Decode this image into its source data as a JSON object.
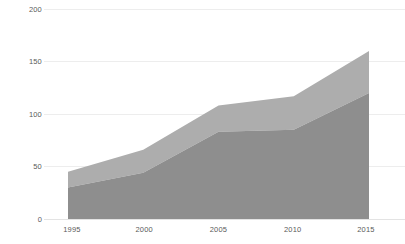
{
  "chart_data": {
    "type": "area",
    "stacked": true,
    "title": "",
    "subtitle": "",
    "xlabel": "",
    "ylabel": "",
    "x": [
      1995,
      2000,
      2005,
      2010,
      2015
    ],
    "categories": [
      "1995",
      "2000",
      "2005",
      "2010",
      "2015"
    ],
    "series": [
      {
        "name": "Lower series",
        "color": "#8e8e8e",
        "values": [
          30,
          44,
          83,
          85,
          120
        ]
      },
      {
        "name": "Upper series",
        "color": "#adadad",
        "values": [
          15,
          22,
          25,
          32,
          40
        ]
      }
    ],
    "cumulative_top": [
      45,
      66,
      108,
      117,
      160
    ],
    "xlim": [
      1995,
      2015
    ],
    "ylim": [
      0,
      200
    ],
    "y_ticks": [
      0,
      50,
      100,
      150,
      200
    ],
    "y_tick_labels": [
      "0",
      "50",
      "100",
      "150",
      "200"
    ],
    "x_ticks": [
      1995,
      2000,
      2005,
      2010,
      2015
    ],
    "x_tick_labels": [
      "1995",
      "2000",
      "2005",
      "2010",
      "2015"
    ],
    "grid": true,
    "grid_axis": "y",
    "legend": false,
    "legend_position": "none",
    "annotations": []
  },
  "axes": {
    "y_labels": [
      "200",
      "150",
      "100",
      "50",
      "0"
    ],
    "x_labels": [
      "1995",
      "2000",
      "2005",
      "2010",
      "2015"
    ]
  },
  "colors": {
    "upper_band": "#adadad",
    "lower_band": "#8e8e8e",
    "gridline": "#ededed",
    "baseline": "#e3e3e3",
    "tick_text": "#5a5a5a",
    "background": "#ffffff"
  }
}
